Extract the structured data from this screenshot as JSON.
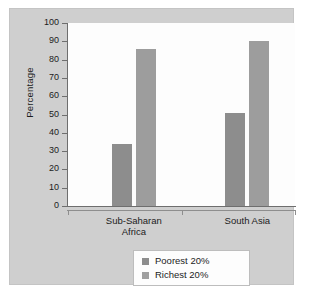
{
  "chart_data": {
    "type": "bar",
    "title": "",
    "subtitle": "",
    "xlabel": "",
    "ylabel": "Percentage",
    "ylim": [
      0,
      100
    ],
    "yticks": [
      0,
      10,
      20,
      30,
      40,
      50,
      60,
      70,
      80,
      90,
      100
    ],
    "ytick_labels": [
      "0",
      "10",
      "20",
      "30",
      "40",
      "50",
      "60",
      "70",
      "80",
      "90",
      "100"
    ],
    "grid": false,
    "legend_position": "bottom-center",
    "categories": [
      "Sub-Saharan Africa",
      "South Asia"
    ],
    "category_label_lines": [
      [
        "Sub-Saharan",
        "Africa"
      ],
      [
        "South Asia"
      ]
    ],
    "series": [
      {
        "name": "Poorest 20%",
        "color": "#8d8d8d",
        "values": [
          34,
          51
        ]
      },
      {
        "name": "Richest 20%",
        "color": "#9d9d9d",
        "values": [
          86,
          90
        ]
      }
    ],
    "annotations": []
  },
  "legend": {
    "entries": [
      {
        "label": "Poorest 20%",
        "swatch": "poorest"
      },
      {
        "label": "Richest 20%",
        "swatch": "richest"
      }
    ]
  },
  "colors": {
    "panel_background": "#cfcfcf",
    "plot_background": "#fdfdfd",
    "axis": "#6e6e6e",
    "text": "#1c1c1c",
    "poorest": "#8d8d8d",
    "richest": "#9d9d9d"
  }
}
